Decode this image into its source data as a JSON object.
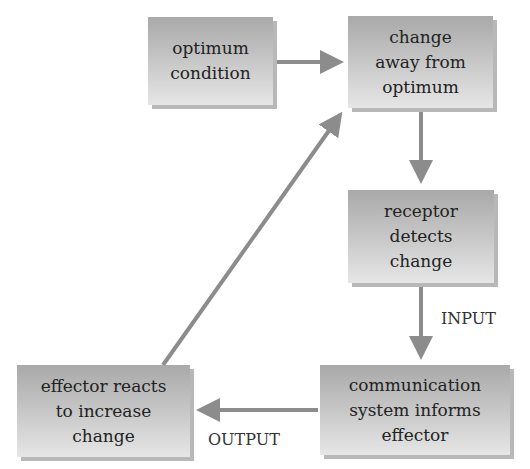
{
  "diagram": {
    "type": "flowchart",
    "nodes": [
      {
        "id": "optimum",
        "label": "optimum\ncondition"
      },
      {
        "id": "change",
        "label": "change\naway from\noptimum"
      },
      {
        "id": "receptor",
        "label": "receptor\ndetects\nchange"
      },
      {
        "id": "communication",
        "label": "communication\nsystem informs\neffector"
      },
      {
        "id": "effector",
        "label": "effector reacts\nto increase\nchange"
      }
    ],
    "edges": [
      {
        "from": "optimum",
        "to": "change",
        "label": ""
      },
      {
        "from": "change",
        "to": "receptor",
        "label": ""
      },
      {
        "from": "receptor",
        "to": "communication",
        "label": "INPUT"
      },
      {
        "from": "communication",
        "to": "effector",
        "label": "OUTPUT"
      },
      {
        "from": "effector",
        "to": "change",
        "label": ""
      }
    ],
    "labels": {
      "input": "INPUT",
      "output": "OUTPUT"
    },
    "colors": {
      "box_top": "#a9a9a9",
      "box_bottom": "#e6e6e6",
      "arrow": "#8c8c8c",
      "text": "#222222"
    }
  }
}
